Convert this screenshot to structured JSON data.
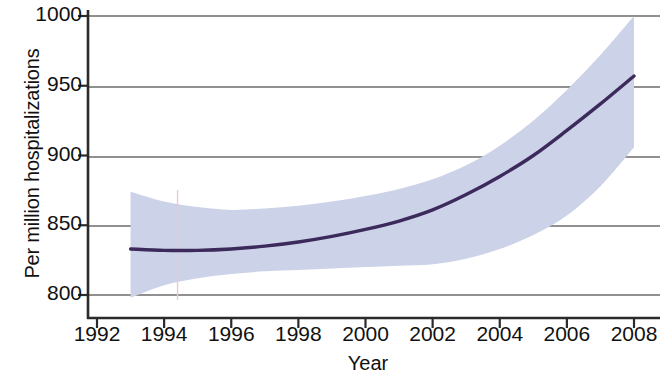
{
  "chart_data": {
    "type": "line",
    "title": "",
    "subtitle": "",
    "xlabel": "Year",
    "ylabel": "Per million hospitalizations",
    "xlim": [
      1991.3,
      2008.7
    ],
    "ylim": [
      787,
      1002
    ],
    "xticks": [
      1992,
      1994,
      1996,
      1998,
      2000,
      2002,
      2004,
      2006,
      2008
    ],
    "xtick_labels": [
      "1992",
      "1994",
      "1996",
      "1998",
      "2000",
      "2002",
      "2004",
      "2006",
      "2008"
    ],
    "yticks": [
      800,
      850,
      900,
      950,
      1000
    ],
    "ytick_labels": [
      "800",
      "850",
      "900",
      "950",
      "1000"
    ],
    "grid": "horizontal",
    "legend": "none",
    "series": [
      {
        "name": "Fitted trend",
        "kind": "line",
        "color": "#3d2a5c",
        "x": [
          1993,
          1994,
          1995,
          1996,
          1997,
          1998,
          1999,
          2000,
          2001,
          2002,
          2003,
          2004,
          2005,
          2006,
          2007,
          2008
        ],
        "values": [
          833,
          832,
          832,
          833,
          835,
          838,
          842,
          847,
          853,
          861,
          872,
          885,
          900,
          918,
          937,
          957
        ]
      },
      {
        "name": "95% confidence band",
        "kind": "band",
        "color": "#ccd2e8",
        "x": [
          1993,
          1994,
          1995,
          1996,
          1997,
          1998,
          1999,
          2000,
          2001,
          2002,
          2003,
          2004,
          2005,
          2006,
          2007,
          2008
        ],
        "upper": [
          874,
          867,
          863,
          861,
          862,
          864,
          867,
          871,
          876,
          883,
          893,
          907,
          925,
          947,
          972,
          1000
        ],
        "lower": [
          798,
          807,
          812,
          815,
          817,
          818,
          819,
          820,
          821,
          822,
          826,
          833,
          843,
          857,
          878,
          906
        ]
      }
    ],
    "annotations": [
      {
        "name": "vertical-reference-line",
        "x": 1994.4,
        "color": "#e8c8d4"
      }
    ]
  },
  "axes": {
    "axis_line_color": "#2b2b2b",
    "grid_line_color": "#6b6b6b",
    "background": "#ffffff"
  }
}
